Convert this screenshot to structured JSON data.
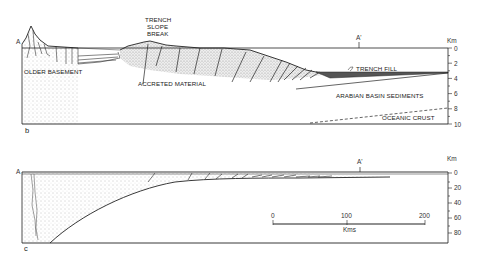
{
  "panel_b": {
    "panel_label": "b",
    "section_start": "A",
    "section_end": "A'",
    "axis_unit": "Km",
    "depth_ticks": [
      "0",
      "2",
      "4",
      "6",
      "8",
      "10"
    ],
    "labels": {
      "trench_slope_break_1": "TRENCH",
      "trench_slope_break_2": "SLOPE",
      "trench_slope_break_3": "BREAK",
      "older_basement": "OLDER BASEMENT",
      "accreted_material": "ACCRETED MATERIAL",
      "trench_fill": "TRENCH FILL",
      "arabian_basin_sediments": "ARABIAN BASIN SEDIMENTS",
      "oceanic_crust": "OCEANIC CRUST"
    }
  },
  "panel_c": {
    "panel_label": "c",
    "section_start": "A",
    "section_end": "A'",
    "axis_unit": "Km",
    "depth_ticks": [
      "0",
      "20",
      "40",
      "60",
      "80"
    ],
    "scale_bar": {
      "ticks": [
        "0",
        "100",
        "200"
      ],
      "unit": "Kms"
    }
  }
}
